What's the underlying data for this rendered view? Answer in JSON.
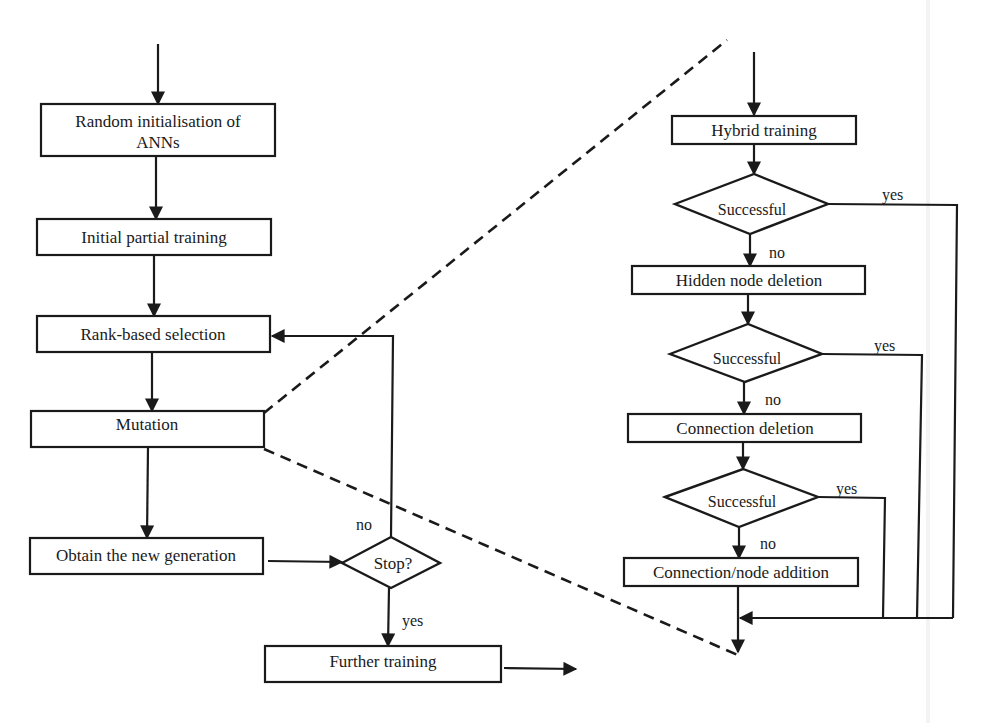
{
  "colors": {
    "ink": "#1a1a1a",
    "background": "#ffffff"
  },
  "left_flow": {
    "boxes": {
      "random_init_line1": "Random initialisation of",
      "random_init_line2": "ANNs",
      "initial_partial_training": "Initial partial training",
      "rank_based_selection": "Rank-based selection",
      "mutation": "Mutation",
      "obtain_new_generation": "Obtain the new generation",
      "further_training": "Further training"
    },
    "decision": {
      "label": "Stop?",
      "no_label": "no",
      "yes_label": "yes"
    }
  },
  "right_flow": {
    "boxes": {
      "hybrid_training": "Hybrid training",
      "hidden_node_deletion": "Hidden node deletion",
      "connection_deletion": "Connection deletion",
      "connection_node_addition": "Connection/node addition"
    },
    "decisions": [
      {
        "label": "Successful",
        "yes_label": "yes",
        "no_label": "no"
      },
      {
        "label": "Successful",
        "yes_label": "yes",
        "no_label": "no"
      },
      {
        "label": "Successful",
        "yes_label": "yes",
        "no_label": "no"
      }
    ]
  }
}
